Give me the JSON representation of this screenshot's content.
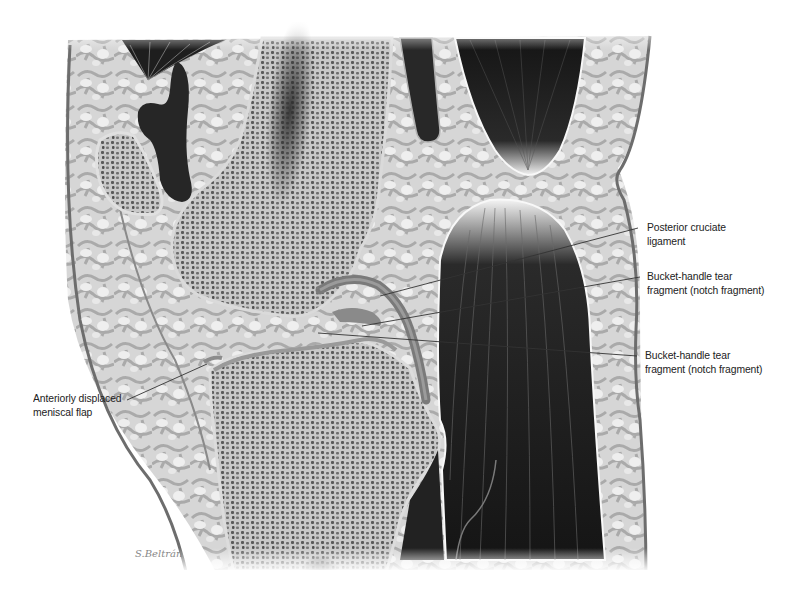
{
  "figure": {
    "colors": {
      "background": "#ffffff",
      "fat_tissue": "#c9c9c9",
      "bone_cortex": "#d8d8d8",
      "bone_trabecular": "#6a6a6a",
      "muscle": "#1c1c1c",
      "skin_line": "#6d6d6d",
      "label_text": "#222222",
      "leader_line": "#333333"
    }
  },
  "labels": {
    "pcl": {
      "line1": "Posterior cruciate",
      "line2": "ligament"
    },
    "bucket_upper": {
      "line1": "Bucket-handle tear",
      "line2": "fragment (notch fragment)"
    },
    "bucket_lower": {
      "line1": "Bucket-handle tear",
      "line2": "fragment (notch fragment)"
    },
    "meniscal_flap": {
      "line1": "Anteriorly displaced",
      "line2": "meniscal flap"
    }
  },
  "signature": "S.Beltrán"
}
